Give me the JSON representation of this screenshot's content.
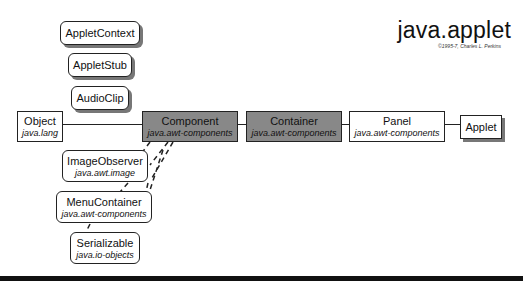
{
  "header": {
    "title": "java.applet",
    "copyright": "©1995-7, Charles L. Perkins"
  },
  "interfaces": [
    {
      "name": "AppletContext"
    },
    {
      "name": "AppletStub"
    },
    {
      "name": "AudioClip"
    }
  ],
  "hierarchy": [
    {
      "name": "Object",
      "package": "java.lang"
    },
    {
      "name": "Component",
      "package": "java.awt-components"
    },
    {
      "name": "Container",
      "package": "java.awt-components"
    },
    {
      "name": "Panel",
      "package": "java.awt-components"
    },
    {
      "name": "Applet",
      "package": ""
    }
  ],
  "implemented": [
    {
      "name": "ImageObserver",
      "package": "java.awt.image"
    },
    {
      "name": "MenuContainer",
      "package": "java.awt-components"
    },
    {
      "name": "Serializable",
      "package": "java.io-objects"
    }
  ],
  "colors": {
    "highlight": "#888888",
    "line": "#222222"
  }
}
